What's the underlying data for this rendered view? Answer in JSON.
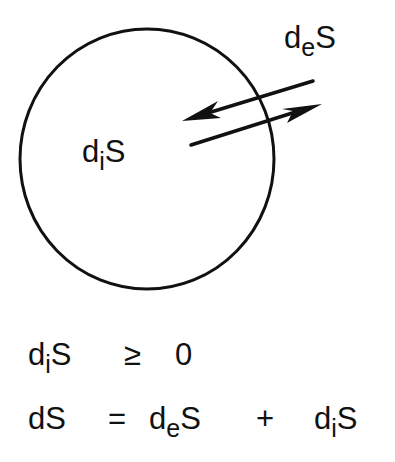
{
  "diagram": {
    "system_boundary": {
      "shape": "circle",
      "stroke": "#111111"
    },
    "labels": {
      "internal": {
        "base": "d",
        "sub": "i",
        "tail": "S"
      },
      "external": {
        "base": "d",
        "sub": "e",
        "tail": "S"
      }
    },
    "arrows": [
      {
        "direction": "inward",
        "meaning": "entropy exchange into system"
      },
      {
        "direction": "outward",
        "meaning": "entropy exchange out of system"
      }
    ]
  },
  "equations": {
    "line1": {
      "lhs": {
        "base": "d",
        "sub": "i",
        "tail": "S"
      },
      "op": "≥",
      "rhs": "0"
    },
    "line2": {
      "lhs": "dS",
      "eq": "=",
      "term1": {
        "base": "d",
        "sub": "e",
        "tail": "S"
      },
      "plus": "+",
      "term2": {
        "base": "d",
        "sub": "i",
        "tail": "S"
      }
    }
  },
  "colors": {
    "ink": "#111111",
    "background": "#ffffff"
  }
}
